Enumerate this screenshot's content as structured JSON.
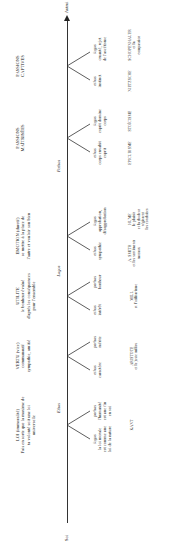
{
  "axis": {
    "start_label": "Soi",
    "end_label": "Autrui"
  },
  "section_labels": [
    {
      "id": "ethos",
      "label": "Ethos",
      "x": 135,
      "y": 57
    },
    {
      "id": "logos",
      "label": "Logos",
      "x": 272,
      "y": 57
    },
    {
      "id": "pathos",
      "label": "Pathos",
      "x": 377,
      "y": 57
    }
  ],
  "columns": [
    {
      "id": "loi",
      "x": 118,
      "header": [
        "LOI (immoralité)",
        "Fais en sorte que la maxime de",
        "ta volonté soit une loi",
        "universelle"
      ],
      "branch_x": 118,
      "left": {
        "title": "logos",
        "lines": [
          "la loi morale",
          "est comme une",
          "loi de la nature"
        ]
      },
      "right": {
        "title": "pathos",
        "lines": [
          "l'humanité",
          "est une fin",
          "en soi"
        ]
      },
      "author": [
        "KANT"
      ]
    },
    {
      "id": "vertu",
      "x": 187,
      "header": [
        "VERTU (vice)",
        "communauté",
        "sympathie, amitié"
      ],
      "branch_x": 187,
      "left": {
        "title": "ethos",
        "lines": [
          "caractère"
        ]
      },
      "right": {
        "title": "pathos",
        "lines": [
          "mérite"
        ]
      },
      "author": [
        "ARISTOTE",
        "et le juste milieu"
      ]
    },
    {
      "id": "utilite",
      "x": 247,
      "header": [
        "UTILITE",
        "le bonheur évalué",
        "d'après les conséquences",
        "pour l'ensemble"
      ],
      "branch_x": 247,
      "left": {
        "title": "ethos",
        "lines": [
          "intérêt"
        ]
      },
      "right": {
        "title": "pathos",
        "lines": [
          "bonheur"
        ]
      },
      "author": [
        "MILL",
        "et l'utilitarisme"
      ]
    },
    {
      "id": "emotion",
      "x": 307,
      "header": [
        "EMOTION (dureté)",
        "se mettre à la place de",
        "l'autre et vouloir son bien"
      ],
      "branch_x": 307,
      "left": {
        "title": "ethos",
        "lines": [
          "sympathie"
        ]
      },
      "right": {
        "title": "logos",
        "lines": [
          "approbation,",
          "désapprobation"
        ]
      },
      "author_left": [
        "A. SMITH",
        "et les sentiments",
        "moraux"
      ],
      "author_right": [
        "HUME",
        "le plaisir",
        "et la douleur",
        "régissent",
        "les conduites"
      ]
    },
    {
      "id": "passions-maitrisees",
      "x": 405,
      "header": [
        "PASSIONS",
        "MAÎTRISÉES"
      ],
      "branch_x": 405,
      "left": {
        "title": "ethos",
        "lines": [
          "corps envahit",
          "esprit"
        ]
      },
      "right": {
        "title": "logos",
        "lines": [
          "esprit domine",
          "corps"
        ]
      },
      "author_left": [
        "EPICURISME"
      ],
      "author_right": [
        "STOÏCISME"
      ]
    },
    {
      "id": "passions-captives",
      "x": 477,
      "header": [
        "PASSIONS",
        "CAPTIVES"
      ],
      "branch_x": 477,
      "left": {
        "title": "ethos",
        "lines": [
          "instinct"
        ]
      },
      "right": {
        "title": "logos",
        "lines": [
          "cruauté, rejet",
          "de l'ascétisme"
        ]
      },
      "author_left": [
        "NIETZSCHE"
      ],
      "author_right": [
        "SCHOPENHAUER",
        "et la",
        "compassion"
      ]
    }
  ]
}
